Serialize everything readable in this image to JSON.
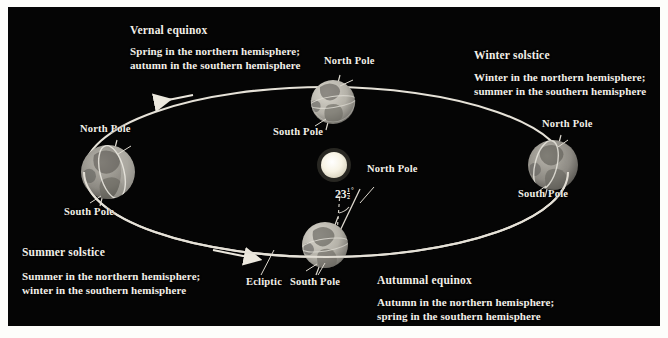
{
  "figure": {
    "background_color": "#050505",
    "page_color": "#fdfdfb",
    "label_color": "#f2efe8"
  },
  "sun": {
    "name": "Sun",
    "center": [
      326,
      158
    ],
    "radius": 13,
    "color": "#fbf8ee"
  },
  "orbit": {
    "name": "Ecliptic",
    "label": "Ecliptic",
    "center": [
      318,
      165
    ],
    "rx": 242,
    "ry": 85,
    "color": "#e8e4da",
    "direction": "counterclockwise",
    "arrow_labels": [
      "orbit-arrow-upper-left",
      "orbit-arrow-lower-left"
    ]
  },
  "tilt": {
    "value": "23",
    "fraction_numerator": "1",
    "fraction_denominator": "2",
    "degree_symbol": "°",
    "full_text": "23½°",
    "description": "axial tilt of Earth"
  },
  "positions": [
    {
      "id": "vernal-equinox",
      "title": "Vernal equinox",
      "body_line1": "Spring in the northern hemisphere;",
      "body_line2": "autumn in the southern hemisphere",
      "earth_center": [
        325,
        95
      ],
      "earth_radius": 22,
      "north_pole_label": "North Pole",
      "south_pole_label": "South Pole"
    },
    {
      "id": "winter-solstice",
      "title": "Winter solstice",
      "body_line1": "Winter in the northern hemisphere;",
      "body_line2": "summer in the southern hemisphere",
      "earth_center": [
        545,
        158
      ],
      "earth_radius": 25,
      "north_pole_label": "North Pole",
      "south_pole_label": "South Pole"
    },
    {
      "id": "summer-solstice",
      "title": "Summer solstice",
      "body_line1": "Summer in the northern hemisphere;",
      "body_line2": "winter in the southern hemisphere",
      "earth_center": [
        100,
        165
      ],
      "earth_radius": 27,
      "north_pole_label": "North Pole",
      "south_pole_label": "South Pole"
    },
    {
      "id": "autumnal-equinox",
      "title": "Autumnal equinox",
      "body_line1": "Autumn in the northern hemisphere;",
      "body_line2": "spring in the southern hemisphere",
      "earth_center": [
        317,
        238
      ],
      "earth_radius": 23,
      "north_pole_label": "North Pole",
      "south_pole_label": "South Pole"
    }
  ],
  "labels": {
    "sun_north_pole": "North Pole"
  }
}
